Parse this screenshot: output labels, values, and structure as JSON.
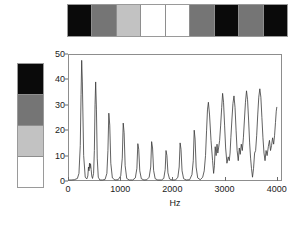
{
  "top_strip": {
    "name": "grayscale-pattern-strip",
    "segments": [
      {
        "label": "black",
        "color": "#0a0a0a"
      },
      {
        "label": "dark-gray",
        "color": "#757575"
      },
      {
        "label": "light-gray",
        "color": "#c2c2c2"
      },
      {
        "label": "white",
        "color": "#ffffff"
      },
      {
        "label": "white",
        "color": "#ffffff"
      },
      {
        "label": "dark-gray",
        "color": "#757575"
      },
      {
        "label": "black",
        "color": "#0a0a0a"
      },
      {
        "label": "dark-gray",
        "color": "#757575"
      },
      {
        "label": "black",
        "color": "#0a0a0a"
      }
    ]
  },
  "legend_bar": {
    "name": "grayscale-level-key",
    "cells": [
      {
        "label": "black",
        "color": "#0a0a0a"
      },
      {
        "label": "dark-gray",
        "color": "#757575"
      },
      {
        "label": "light-gray",
        "color": "#c2c2c2"
      },
      {
        "label": "white",
        "color": "#ffffff"
      }
    ]
  },
  "chart_data": {
    "type": "line",
    "title": "",
    "xlabel": "Hz",
    "ylabel": "",
    "xlim": [
      0,
      4100
    ],
    "ylim": [
      0,
      50
    ],
    "grid": false,
    "legend": "none",
    "xticks": [
      0,
      1000,
      2000,
      3000,
      4000
    ],
    "xticklabels": [
      "0",
      "1000",
      "2000",
      "3000",
      "4000"
    ],
    "yticks": [
      0,
      10,
      20,
      30,
      40,
      50
    ],
    "yticklabels": [
      "0",
      "10",
      "20",
      "30",
      "40",
      "50"
    ],
    "line_color": "#3a3a3a",
    "series": [
      {
        "name": "spectrum",
        "x": [
          0,
          60,
          120,
          180,
          210,
          235,
          250,
          262,
          275,
          300,
          330,
          360,
          380,
          392,
          402,
          412,
          420,
          432,
          444,
          455,
          470,
          490,
          505,
          518,
          530,
          545,
          560,
          580,
          610,
          660,
          710,
          745,
          765,
          782,
          800,
          820,
          850,
          900,
          960,
          1010,
          1040,
          1058,
          1075,
          1095,
          1125,
          1175,
          1240,
          1290,
          1320,
          1338,
          1355,
          1375,
          1405,
          1455,
          1510,
          1555,
          1585,
          1602,
          1620,
          1640,
          1670,
          1720,
          1790,
          1835,
          1862,
          1878,
          1895,
          1915,
          1945,
          1995,
          2060,
          2105,
          2130,
          2148,
          2165,
          2185,
          2215,
          2265,
          2330,
          2375,
          2400,
          2418,
          2435,
          2455,
          2485,
          2535,
          2580,
          2610,
          2635,
          2655,
          2672,
          2690,
          2712,
          2740,
          2770,
          2790,
          2805,
          2820,
          2838,
          2855,
          2870,
          2885,
          2905,
          2925,
          2945,
          2962,
          2980,
          3000,
          3020,
          3045,
          3070,
          3090,
          3105,
          3120,
          3140,
          3160,
          3180,
          3200,
          3220,
          3240,
          3262,
          3282,
          3300,
          3320,
          3340,
          3360,
          3380,
          3400,
          3420,
          3440,
          3460,
          3480,
          3498,
          3515,
          3535,
          3555,
          3575,
          3595,
          3615,
          3635,
          3655,
          3675,
          3695,
          3715,
          3735,
          3755,
          3775,
          3795,
          3815,
          3838,
          3860,
          3880,
          3900,
          3920,
          3940,
          3958,
          3975,
          3990,
          4000
        ],
        "y": [
          0.4,
          0.4,
          0.5,
          1.0,
          3.0,
          14.0,
          34.0,
          47.5,
          39.0,
          10.0,
          1.5,
          0.8,
          2.0,
          5.5,
          4.0,
          7.0,
          5.0,
          6.8,
          4.5,
          2.0,
          1.0,
          3.0,
          12.0,
          30.0,
          39.0,
          28.0,
          9.0,
          1.5,
          0.4,
          0.4,
          0.6,
          3.0,
          12.0,
          26.7,
          22.0,
          7.0,
          1.2,
          0.4,
          0.5,
          2.0,
          9.0,
          22.8,
          19.0,
          6.0,
          1.0,
          0.4,
          0.4,
          1.2,
          5.0,
          14.7,
          12.5,
          4.0,
          0.9,
          0.4,
          0.5,
          1.5,
          5.5,
          15.5,
          13.0,
          4.2,
          0.9,
          0.4,
          0.4,
          1.0,
          4.5,
          12.0,
          10.0,
          3.2,
          0.8,
          0.4,
          0.4,
          1.5,
          5.5,
          15.0,
          12.5,
          4.0,
          0.9,
          0.4,
          0.5,
          2.5,
          8.0,
          20.0,
          16.5,
          5.5,
          1.2,
          0.5,
          1.5,
          4.0,
          10.0,
          20.0,
          28.0,
          31.0,
          26.0,
          16.0,
          8.0,
          3.0,
          6.0,
          13.5,
          10.0,
          14.5,
          11.0,
          13.0,
          16.0,
          22.0,
          29.0,
          34.5,
          31.0,
          22.0,
          13.0,
          7.0,
          9.5,
          8.0,
          11.0,
          17.0,
          24.0,
          30.5,
          33.5,
          29.0,
          20.0,
          12.0,
          8.0,
          13.0,
          10.5,
          14.5,
          12.0,
          17.0,
          24.0,
          31.0,
          35.5,
          32.0,
          24.0,
          15.0,
          9.0,
          5.0,
          1.5,
          5.0,
          11.0,
          12.0,
          18.0,
          26.0,
          33.0,
          36.3,
          33.0,
          25.0,
          17.0,
          11.0,
          8.0,
          12.0,
          10.0,
          13.5,
          16.0,
          12.0,
          14.0,
          17.0,
          14.5,
          18.0,
          23.0,
          27.5,
          29.0
        ]
      }
    ]
  }
}
